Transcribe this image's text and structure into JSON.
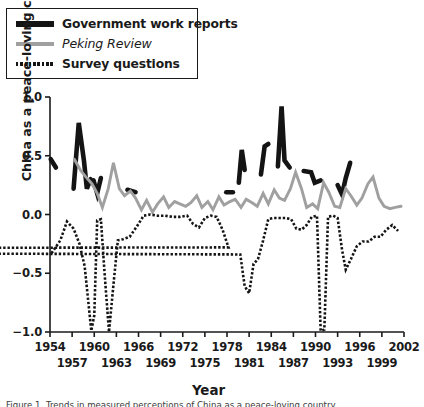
{
  "figure": {
    "y_axis_title": "China as a peace-loving country*",
    "x_axis_title": "Year",
    "caption": "Figure 1.  Trends in measured perceptions of China as a peace-loving country."
  },
  "legend": {
    "position": "top-left",
    "items": [
      {
        "label": "Government work reports",
        "icon": "thick-black-line-icon",
        "style": "solid",
        "color": "#141414"
      },
      {
        "label": "Peking Review",
        "icon": "gray-line-icon",
        "style": "solid",
        "color": "#a0a0a0"
      },
      {
        "label": "Survey questions",
        "icon": "dotted-line-icon",
        "style": "dotted",
        "color": "#141414"
      }
    ]
  },
  "chart_data": {
    "type": "line",
    "title": "",
    "xlabel": "Year",
    "ylabel": "China as a peace-loving country*",
    "xlim": [
      1954,
      2002
    ],
    "ylim": [
      -1.0,
      1.0
    ],
    "yticks": [
      1.0,
      0.5,
      0.0,
      -0.5,
      -1.0
    ],
    "ytick_labels": [
      "1.0",
      "0.5",
      "0.0",
      "-0.5",
      "-1.0"
    ],
    "xticks": [
      1954,
      1957,
      1960,
      1963,
      1966,
      1969,
      1972,
      1975,
      1978,
      1981,
      1984,
      1987,
      1990,
      1993,
      1996,
      1999,
      2002
    ],
    "xtick_labels": [
      "1954",
      "1957",
      "1960",
      "1963",
      "1966",
      "1969",
      "1972",
      "1975",
      "1978",
      "1981",
      "1984",
      "1987",
      "1990",
      "1993",
      "1996",
      "1999",
      "2002"
    ],
    "xtick_stagger": true,
    "grid": false,
    "series": [
      {
        "name": "Government work reports",
        "color": "#141414",
        "style": "solid",
        "width": 4.6,
        "segments": [
          [
            [
              1954.1,
              0.47
            ],
            [
              1954.8,
              0.4
            ]
          ],
          [
            [
              1957.2,
              0.22
            ],
            [
              1957.9,
              0.78
            ],
            [
              1958.6,
              0.46
            ],
            [
              1959.0,
              0.22
            ],
            [
              1959.5,
              0.3
            ]
          ],
          [
            [
              1959.9,
              0.29
            ],
            [
              1960.4,
              0.18
            ],
            [
              1960.9,
              0.31
            ]
          ],
          [
            [
              1964.5,
              0.21
            ],
            [
              1965.6,
              0.19
            ]
          ],
          [
            [
              1977.9,
              0.19
            ],
            [
              1978.8,
              0.19
            ]
          ],
          [
            [
              1979.6,
              0.27
            ],
            [
              1980.0,
              0.55
            ],
            [
              1980.4,
              0.38
            ]
          ],
          [
            [
              1982.6,
              0.34
            ],
            [
              1983.1,
              0.58
            ],
            [
              1983.6,
              0.6
            ]
          ],
          [
            [
              1984.9,
              0.41
            ],
            [
              1985.4,
              0.92
            ],
            [
              1985.8,
              0.46
            ],
            [
              1986.5,
              0.4
            ]
          ],
          [
            [
              1988.4,
              0.37
            ],
            [
              1989.4,
              0.36
            ],
            [
              1989.9,
              0.27
            ],
            [
              1990.7,
              0.29
            ]
          ],
          [
            [
              1993.0,
              0.25
            ],
            [
              1993.6,
              0.17
            ],
            [
              1994.1,
              0.31
            ],
            [
              1994.7,
              0.44
            ]
          ]
        ]
      },
      {
        "name": "Peking Review",
        "color": "#a0a0a0",
        "style": "solid",
        "width": 2.9,
        "points": [
          [
            1957.3,
            0.47
          ],
          [
            1958.2,
            0.37
          ],
          [
            1959.0,
            0.31
          ],
          [
            1959.7,
            0.26
          ],
          [
            1960.4,
            0.18
          ],
          [
            1961.1,
            0.06
          ],
          [
            1961.9,
            0.22
          ],
          [
            1962.6,
            0.44
          ],
          [
            1963.4,
            0.22
          ],
          [
            1964.1,
            0.16
          ],
          [
            1964.9,
            0.2
          ],
          [
            1965.6,
            0.14
          ],
          [
            1966.4,
            0.04
          ],
          [
            1967.1,
            0.12
          ],
          [
            1967.9,
            0.02
          ],
          [
            1968.6,
            0.09
          ],
          [
            1969.4,
            0.15
          ],
          [
            1970.1,
            0.06
          ],
          [
            1970.9,
            0.11
          ],
          [
            1971.6,
            0.09
          ],
          [
            1972.4,
            0.07
          ],
          [
            1973.1,
            0.1
          ],
          [
            1973.9,
            0.16
          ],
          [
            1974.6,
            0.06
          ],
          [
            1975.4,
            0.11
          ],
          [
            1976.1,
            0.04
          ],
          [
            1976.9,
            0.15
          ],
          [
            1977.6,
            0.08
          ],
          [
            1978.4,
            0.11
          ],
          [
            1979.1,
            0.13
          ],
          [
            1979.9,
            0.06
          ],
          [
            1980.6,
            0.13
          ],
          [
            1981.4,
            0.1
          ],
          [
            1982.1,
            0.07
          ],
          [
            1982.9,
            0.18
          ],
          [
            1983.6,
            0.09
          ],
          [
            1984.4,
            0.21
          ],
          [
            1985.1,
            0.14
          ],
          [
            1985.8,
            0.12
          ],
          [
            1986.6,
            0.22
          ],
          [
            1987.3,
            0.36
          ],
          [
            1988.1,
            0.22
          ],
          [
            1988.8,
            0.06
          ],
          [
            1989.6,
            0.09
          ],
          [
            1990.3,
            0.05
          ],
          [
            1991.1,
            0.27
          ],
          [
            1991.8,
            0.19
          ],
          [
            1992.6,
            0.07
          ],
          [
            1993.3,
            0.06
          ],
          [
            1994.1,
            0.22
          ],
          [
            1994.8,
            0.16
          ],
          [
            1995.6,
            0.08
          ],
          [
            1996.3,
            0.14
          ],
          [
            1997.1,
            0.26
          ],
          [
            1997.8,
            0.32
          ],
          [
            1998.6,
            0.14
          ],
          [
            1999.3,
            0.07
          ],
          [
            2000.1,
            0.05
          ],
          [
            2000.8,
            0.06
          ],
          [
            2001.6,
            0.07
          ]
        ]
      },
      {
        "name": "Survey questions",
        "color": "#141414",
        "style": "dotted",
        "width": 2.6,
        "points": [
          [
            1954.2,
            -0.33
          ],
          [
            1955.4,
            -0.22
          ],
          [
            1956.3,
            -0.06
          ],
          [
            1957.2,
            -0.12
          ],
          [
            1958.0,
            -0.25
          ],
          [
            1958.7,
            -0.44
          ],
          [
            1959.6,
            -0.99
          ],
          [
            1960.0,
            -0.86
          ],
          [
            1960.4,
            -0.05
          ],
          [
            1960.9,
            -0.04
          ],
          [
            1961.4,
            -0.5
          ],
          [
            1962.0,
            -1.0
          ],
          [
            1962.6,
            -0.6
          ],
          [
            1963.2,
            -0.22
          ],
          [
            1963.9,
            -0.21
          ],
          [
            1964.8,
            -0.19
          ],
          [
            1965.8,
            -0.1
          ],
          [
            1966.7,
            -0.01
          ],
          [
            1967.6,
            0.0
          ],
          [
            1968.6,
            -0.01
          ],
          [
            1969.6,
            -0.01
          ],
          [
            1970.6,
            -0.02
          ],
          [
            1971.6,
            -0.02
          ],
          [
            1972.6,
            -0.01
          ],
          [
            1973.4,
            -0.08
          ],
          [
            1974.2,
            -0.11
          ],
          [
            1975.0,
            -0.03
          ],
          [
            1975.8,
            -0.01
          ],
          [
            1976.6,
            -0.02
          ],
          [
            1977.4,
            -0.13
          ],
          [
            1978.2,
            -0.28
          ],
          [
            1779.0,
            -0.3
          ],
          [
            1979.8,
            -0.34
          ],
          [
            1980.4,
            -0.61
          ],
          [
            1981.0,
            -0.67
          ],
          [
            1981.6,
            -0.42
          ],
          [
            1982.2,
            -0.38
          ],
          [
            1982.9,
            -0.22
          ],
          [
            1983.6,
            -0.04
          ],
          [
            1984.3,
            -0.03
          ],
          [
            1985.1,
            -0.03
          ],
          [
            1985.9,
            -0.03
          ],
          [
            1986.7,
            -0.04
          ],
          [
            1987.4,
            -0.12
          ],
          [
            1988.1,
            -0.13
          ],
          [
            1988.8,
            -0.09
          ],
          [
            1989.5,
            -0.02
          ],
          [
            1990.2,
            -0.01
          ],
          [
            1990.7,
            -0.99
          ],
          [
            1991.2,
            -0.98
          ],
          [
            1991.7,
            -0.02
          ],
          [
            1992.4,
            -0.01
          ],
          [
            1993.0,
            -0.03
          ],
          [
            1993.6,
            -0.3
          ],
          [
            1994.1,
            -0.47
          ],
          [
            1994.8,
            -0.38
          ],
          [
            1995.6,
            -0.27
          ],
          [
            1996.4,
            -0.23
          ],
          [
            1997.2,
            -0.23
          ],
          [
            1998.0,
            -0.19
          ],
          [
            1998.8,
            -0.19
          ],
          [
            1999.6,
            -0.13
          ],
          [
            2000.4,
            -0.09
          ],
          [
            2001.2,
            -0.14
          ]
        ]
      }
    ]
  }
}
